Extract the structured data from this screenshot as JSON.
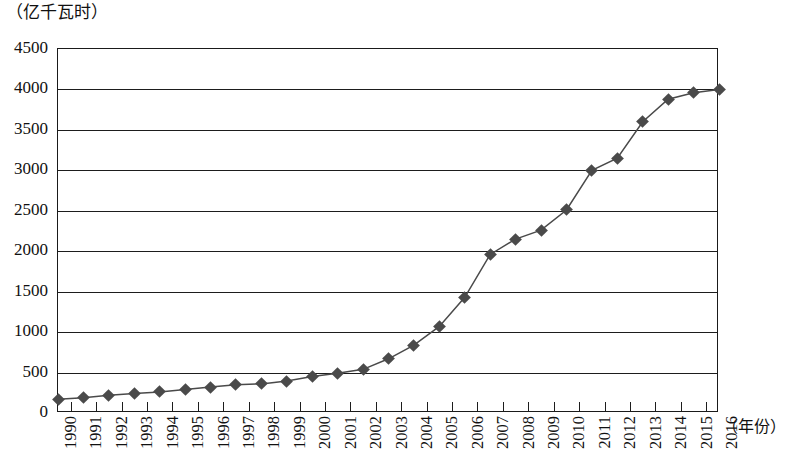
{
  "chart_data": {
    "type": "line",
    "title": "",
    "subtitle": "",
    "xlabel": "（年份）",
    "ylabel": "（亿千瓦时）",
    "ylim": [
      0,
      4500
    ],
    "ytick_step": 500,
    "grid": true,
    "legend": "none",
    "marker": "diamond",
    "series_color": "#4a4a4a",
    "line_color": "#4a4a4a",
    "yticks": [
      "4500",
      "4000",
      "3500",
      "3000",
      "2500",
      "2000",
      "1500",
      "1000",
      "500",
      "0"
    ],
    "categories": [
      "1990",
      "1991",
      "1992",
      "1993",
      "1994",
      "1995",
      "1996",
      "1997",
      "1998",
      "1999",
      "2000",
      "2001",
      "2002",
      "2003",
      "2004",
      "2005",
      "2006",
      "2007",
      "2008",
      "2009",
      "2010",
      "2011",
      "2012",
      "2013",
      "2014",
      "2015",
      "2016"
    ],
    "series": [
      {
        "name": "发电量",
        "values": [
          170,
          190,
          220,
          240,
          260,
          290,
          320,
          350,
          360,
          395,
          450,
          490,
          540,
          670,
          840,
          1070,
          1430,
          1960,
          2150,
          2260,
          2510,
          3000,
          3150,
          3600,
          3880,
          3960,
          4000
        ]
      }
    ]
  },
  "axis": {
    "y_unit_caption": "（亿千瓦时）",
    "x_unit_caption": "（年份）"
  }
}
